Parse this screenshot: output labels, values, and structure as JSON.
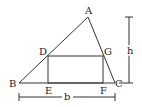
{
  "diagram": {
    "points": {
      "A": {
        "label": "A",
        "x": 88,
        "y": 17
      },
      "B": {
        "label": "B",
        "x": 19,
        "y": 83
      },
      "C": {
        "label": "C",
        "x": 115,
        "y": 83
      },
      "D": {
        "label": "D",
        "x": 48,
        "y": 56
      },
      "E": {
        "label": "E",
        "x": 48,
        "y": 83
      },
      "F": {
        "label": "F",
        "x": 103,
        "y": 83
      },
      "G": {
        "label": "G",
        "x": 103,
        "y": 56
      }
    },
    "dimensions": {
      "height_label": "h",
      "base_label": "b"
    }
  }
}
